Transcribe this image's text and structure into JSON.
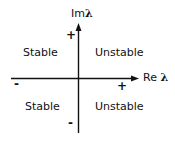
{
  "diagram": {
    "axes": {
      "vertical": {
        "label_prefix": "Im",
        "label_symbol": "λ",
        "positive_sign": "+",
        "negative_sign": "-"
      },
      "horizontal": {
        "label_prefix": "Re",
        "label_symbol": "λ",
        "positive_sign": "+",
        "negative_sign": "-"
      }
    },
    "regions": {
      "upper_left": "Stable",
      "upper_right": "Unstable",
      "lower_left": "Stable",
      "lower_right": "Unstable"
    },
    "colors": {
      "axis": "#111111",
      "text": "#111111",
      "background": "#ffffff"
    }
  }
}
